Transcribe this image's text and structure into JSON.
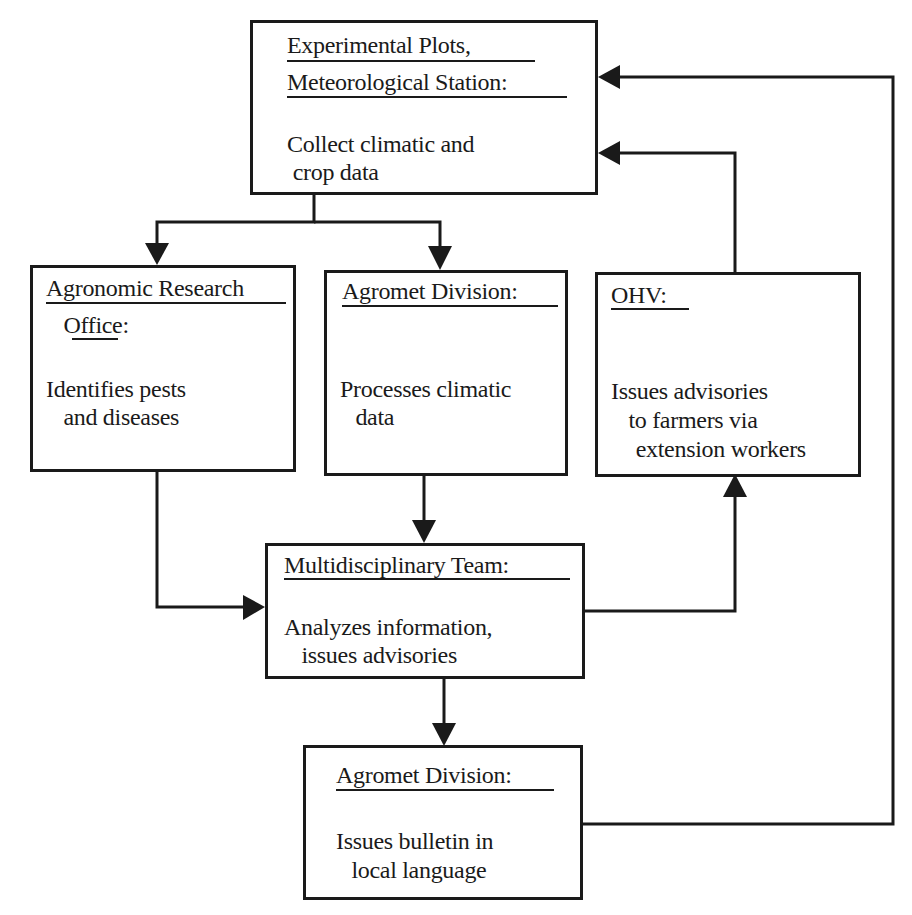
{
  "diagram": {
    "nodes": [
      {
        "id": "station",
        "title_lines": [
          "Experimental Plots,",
          "Meteorological Station:"
        ],
        "body_lines": [
          "Collect climatic and",
          " crop data"
        ]
      },
      {
        "id": "agronomic",
        "title_lines": [
          "Agronomic Research",
          "  Office:"
        ],
        "body_lines": [
          "Identifies pests",
          "  and diseases"
        ]
      },
      {
        "id": "agromet_process",
        "title_lines": [
          "Agromet Division:"
        ],
        "body_lines": [
          "Processes climatic",
          "  data"
        ]
      },
      {
        "id": "ohv",
        "title_lines": [
          "OHV:"
        ],
        "body_lines": [
          "Issues advisories",
          "  to farmers via",
          " extension workers"
        ]
      },
      {
        "id": "team",
        "title_lines": [
          "Multidisciplinary Team:"
        ],
        "body_lines": [
          "Analyzes information,",
          "  issues advisories"
        ]
      },
      {
        "id": "agromet_bulletin",
        "title_lines": [
          "Agromet Division:"
        ],
        "body_lines": [
          "Issues bulletin in",
          "  local language"
        ]
      }
    ],
    "edges": [
      {
        "from": "station",
        "to": "agronomic"
      },
      {
        "from": "station",
        "to": "agromet_process"
      },
      {
        "from": "agronomic",
        "to": "team"
      },
      {
        "from": "agromet_process",
        "to": "team"
      },
      {
        "from": "team",
        "to": "ohv"
      },
      {
        "from": "team",
        "to": "agromet_bulletin"
      },
      {
        "from": "ohv",
        "to": "station"
      },
      {
        "from": "agromet_bulletin",
        "to": "station"
      }
    ]
  }
}
